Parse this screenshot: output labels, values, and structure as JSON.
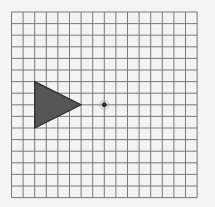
{
  "grid": {
    "columns": 16,
    "rows": 16,
    "origin_x": 11.5,
    "origin_y": 12,
    "cell": 11.6,
    "line_color": "#7a7a7a",
    "background": "#f3f3f3"
  },
  "shapes": {
    "triangle": {
      "points_grid": [
        [
          2,
          6
        ],
        [
          6,
          8
        ],
        [
          2,
          10
        ]
      ],
      "fill": "#555555",
      "stroke": "#2a2a2a"
    },
    "center_point": {
      "grid": [
        8,
        8
      ],
      "fill": "#333333"
    }
  }
}
